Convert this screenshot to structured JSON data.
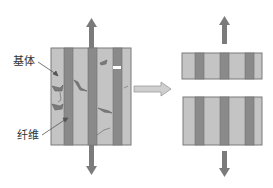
{
  "diagram": {
    "labels": {
      "matrix": "基体",
      "fiber": "纤维"
    },
    "colors": {
      "matrix": "#c4c4c4",
      "fiber": "#8a8a8a",
      "border": "#6e6e6e",
      "arrow": "#7b7b7b",
      "process_arrow_fill": "#cfcfcf",
      "process_arrow_stroke": "#9a9a9a",
      "crack": "#6a6a6a"
    },
    "stages": [
      {
        "name": "intact-composite-with-cracks",
        "fiber_count": 3,
        "load": "tension-vertical"
      },
      {
        "name": "fractured-composite",
        "pieces": 2,
        "fiber_count_per_piece": 3,
        "load": "tension-vertical"
      }
    ]
  }
}
